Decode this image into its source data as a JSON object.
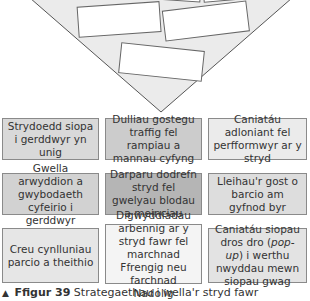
{
  "funnel": {
    "fill": "#ebebeb",
    "stroke": "#555555",
    "empty_boxes": 5
  },
  "grid": {
    "cells": [
      {
        "text": "Strydoedd siopa i gerddwyr yn unig",
        "color": "#d9d9d9"
      },
      {
        "text": "Dulliau gostegu traffig fel rampiau a mannau cyfyng",
        "color": "#cccccc"
      },
      {
        "text": "Caniatáu adloniant fel perfformwyr ar y stryd",
        "color": "#ebebeb"
      },
      {
        "text": "Gwella arwyddion a gwybodaeth cyfeirio i gerddwyr",
        "color": "#d2d2d2"
      },
      {
        "text": "Darparu dodrefn stryd fel gwelyau blodau a meinciau",
        "color": "#b5b5b5"
      },
      {
        "text": "Lleihau'r gost o barcio am gyfnod byr",
        "color": "#dddddd"
      },
      {
        "text": "Creu cynlluniau parcio a theithio",
        "color": "#e6e6e6"
      },
      {
        "text": "Digwyddiadau arbennig ar y stryd fawr fel marchnad Ffrengig neu farchnad Nadolig",
        "color": "#f4f4f4"
      },
      {
        "text_before": "Caniatáu siopau dros dro (",
        "text_em": "pop-up",
        "text_after": ") i werthu nwyddau mewn siopau gwag",
        "color": "#e3e3e3"
      }
    ]
  },
  "caption": {
    "marker": "▲",
    "label": "Ffigur 39",
    "text": "Strategaethau i wella'r stryd fawr"
  }
}
